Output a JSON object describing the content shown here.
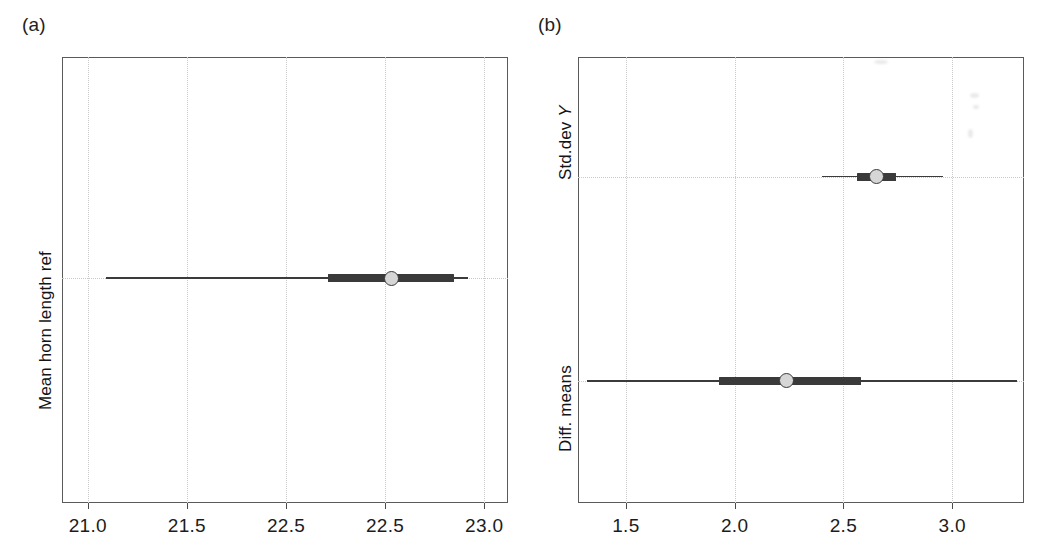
{
  "figure": {
    "panel_a_label": "(a)",
    "panel_b_label": "(b)"
  },
  "chart_data": {
    "type": "interval",
    "title": "",
    "panels": [
      {
        "label": "(a)",
        "ylabel": "Mean horn length ref",
        "xlabel": "",
        "xlim": [
          20.87,
          23.12
        ],
        "ticks": [
          {
            "value": 21.0,
            "label": "21.0"
          },
          {
            "value": 21.5,
            "label": "21.5"
          },
          {
            "value": 22.0,
            "label": "22.5"
          },
          {
            "value": 22.5,
            "label": "22.5"
          },
          {
            "value": 23.0,
            "label": "23.0"
          }
        ],
        "grid": true,
        "rows": [
          {
            "name": "Mean horn length ref",
            "point": 22.53,
            "inner_low": 22.21,
            "inner_high": 22.85,
            "outer_low": 21.09,
            "outer_high": 22.92
          }
        ]
      },
      {
        "label": "(b)",
        "ylabel": "",
        "xlabel": "",
        "xlim": [
          1.28,
          3.33
        ],
        "ticks": [
          {
            "value": 1.5,
            "label": "1.5"
          },
          {
            "value": 2.0,
            "label": "2.0"
          },
          {
            "value": 2.5,
            "label": "2.5"
          },
          {
            "value": 3.0,
            "label": "3.0"
          }
        ],
        "grid": true,
        "rows": [
          {
            "name": "Std.dev Y",
            "label_prefix": "Std.dev ",
            "label_variable": "Y",
            "point": 2.65,
            "inner_low": 2.56,
            "inner_high": 2.74,
            "outer_low": 2.4,
            "outer_high": 2.96
          },
          {
            "name": "Diff. means",
            "label_prefix": "Diff. means",
            "label_variable": "",
            "point": 2.24,
            "inner_low": 1.93,
            "inner_high": 2.58,
            "outer_low": 1.32,
            "outer_high": 3.3
          }
        ]
      }
    ]
  }
}
